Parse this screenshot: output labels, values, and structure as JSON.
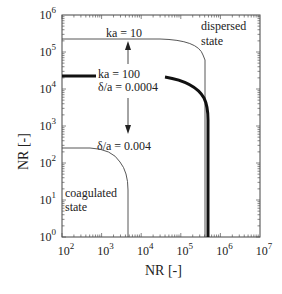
{
  "chart_data": {
    "type": "line",
    "title": "",
    "xlabel": "NR [-]",
    "ylabel": "NR [-]",
    "xscale": "log",
    "yscale": "log",
    "xlim": [
      100,
      10000000
    ],
    "ylim": [
      1,
      1000000
    ],
    "xticks": [
      "10^2",
      "10^3",
      "10^4",
      "10^5",
      "10^6",
      "10^7"
    ],
    "yticks": [
      "10^0",
      "10^1",
      "10^2",
      "10^3",
      "10^4",
      "10^5",
      "10^6"
    ],
    "grid": false,
    "legend": null,
    "series": [
      {
        "name": "ka = 10",
        "style": "thin",
        "plateau_y": 220000,
        "cutoff_x": 400000,
        "points": [
          [
            100,
            220000
          ],
          [
            10000,
            220000
          ],
          [
            100000,
            190000
          ],
          [
            300000,
            100000
          ],
          [
            400000,
            1
          ]
        ]
      },
      {
        "name": "ka = 100, δ/a = 0.0004",
        "style": "thick",
        "plateau_y": 22000,
        "cutoff_x": 490000,
        "points": [
          [
            100,
            22000
          ],
          [
            1000,
            22000
          ],
          [
            40000,
            22000
          ],
          [
            150000,
            15000
          ],
          [
            400000,
            3000
          ],
          [
            490000,
            1
          ]
        ]
      },
      {
        "name": "δ/a = 0.004",
        "style": "thin",
        "plateau_y": 250,
        "cutoff_x": 4600,
        "points": [
          [
            100,
            250
          ],
          [
            400,
            250
          ],
          [
            1500,
            200
          ],
          [
            3500,
            60
          ],
          [
            4600,
            1
          ]
        ]
      }
    ],
    "annotations": [
      {
        "text": "ka = 10",
        "x": 5000,
        "y": 300000
      },
      {
        "text": "ka = 100",
        "x": 5000,
        "y": 30000
      },
      {
        "text": "δ/a = 0.0004",
        "x": 5000,
        "y": 14000
      },
      {
        "text": "δ/a = 0.004",
        "x": 5000,
        "y": 300
      },
      {
        "text": "dispersed state",
        "x": 600000,
        "y": 500000
      },
      {
        "text": "coagulated state",
        "x": 110,
        "y": 10
      },
      {
        "text": "arrow up",
        "from_y": 30000,
        "to_y": 220000,
        "x": 3000
      },
      {
        "text": "arrow down",
        "from_y": 14000,
        "to_y": 400,
        "x": 3000
      }
    ]
  },
  "labels": {
    "ylabel": "NR [-]",
    "xlabel": "NR [-]",
    "ka10": "ka = 10",
    "ka100": "ka = 100",
    "delta1": "δ/a = 0.0004",
    "delta2": "δ/a = 0.004",
    "dispersed1": "dispersed",
    "dispersed2": "state",
    "coag1": "coagulated",
    "coag2": "state"
  },
  "ticks": {
    "x": [
      {
        "base": "10",
        "exp": "2"
      },
      {
        "base": "10",
        "exp": "3"
      },
      {
        "base": "10",
        "exp": "4"
      },
      {
        "base": "10",
        "exp": "5"
      },
      {
        "base": "10",
        "exp": "6"
      },
      {
        "base": "10",
        "exp": "7"
      }
    ],
    "y": [
      {
        "base": "10",
        "exp": "0"
      },
      {
        "base": "10",
        "exp": "1"
      },
      {
        "base": "10",
        "exp": "2"
      },
      {
        "base": "10",
        "exp": "3"
      },
      {
        "base": "10",
        "exp": "4"
      },
      {
        "base": "10",
        "exp": "5"
      },
      {
        "base": "10",
        "exp": "6"
      }
    ]
  }
}
